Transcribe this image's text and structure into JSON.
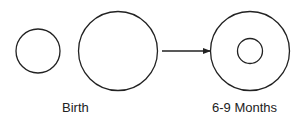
{
  "diagram": {
    "stroke_color": "#222222",
    "background": "#ffffff",
    "stages": [
      {
        "label": "Birth",
        "shapes": [
          "small-circle",
          "large-circle"
        ]
      },
      {
        "label": "6-9 Months",
        "shapes": [
          "large-circle-with-inner-circle"
        ]
      }
    ],
    "connector": "arrow-right"
  }
}
